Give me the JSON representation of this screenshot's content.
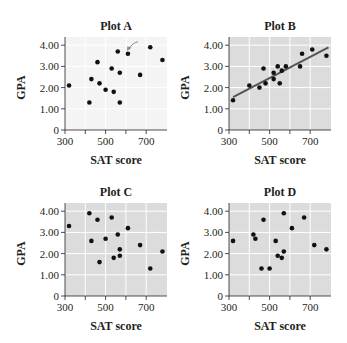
{
  "chart_data": [
    {
      "type": "scatter",
      "title": "Plot A",
      "xlabel": "SAT score",
      "ylabel": "GPA",
      "xlim": [
        300,
        800
      ],
      "ylim": [
        0,
        4.4
      ],
      "x_ticks": [
        "300",
        "500",
        "700"
      ],
      "y_ticks": [
        "0",
        "1.00",
        "2.00",
        "3.00",
        "4.00"
      ],
      "grid": true,
      "background": "#f4f4f4",
      "annotation": "arrow pointing to point near (610, 3.6)",
      "x": [
        320,
        420,
        430,
        460,
        470,
        500,
        530,
        540,
        560,
        570,
        570,
        610,
        670,
        720,
        780
      ],
      "y": [
        2.1,
        1.3,
        2.4,
        3.2,
        2.2,
        1.9,
        2.9,
        1.8,
        3.7,
        2.7,
        1.3,
        3.6,
        2.6,
        3.9,
        3.3
      ]
    },
    {
      "type": "scatter",
      "title": "Plot B",
      "xlabel": "SAT score",
      "ylabel": "GPA",
      "xlim": [
        300,
        800
      ],
      "ylim": [
        0,
        4.4
      ],
      "x_ticks": [
        "300",
        "500",
        "700"
      ],
      "y_ticks": [
        "0",
        "1.00",
        "2.00",
        "3.00",
        "4.00"
      ],
      "grid": true,
      "background": "#dcdcdc",
      "trendline": {
        "x": [
          320,
          790
        ],
        "y": [
          1.55,
          3.9
        ]
      },
      "x": [
        320,
        400,
        450,
        470,
        480,
        520,
        520,
        540,
        550,
        560,
        580,
        650,
        660,
        710,
        780
      ],
      "y": [
        1.4,
        2.1,
        2.0,
        2.9,
        2.2,
        2.7,
        2.4,
        3.0,
        2.2,
        2.8,
        3.0,
        3.0,
        3.6,
        3.8,
        3.5
      ]
    },
    {
      "type": "scatter",
      "title": "Plot C",
      "xlabel": "SAT score",
      "ylabel": "GPA",
      "xlim": [
        300,
        800
      ],
      "ylim": [
        0,
        4.4
      ],
      "x_ticks": [
        "300",
        "500",
        "700"
      ],
      "y_ticks": [
        "0",
        "1.00",
        "2.00",
        "3.00",
        "4.00"
      ],
      "grid": true,
      "background": "#dcdcdc",
      "x": [
        320,
        420,
        430,
        460,
        470,
        500,
        530,
        540,
        560,
        570,
        570,
        610,
        670,
        720,
        780
      ],
      "y": [
        3.3,
        3.9,
        2.6,
        3.6,
        1.6,
        2.7,
        3.7,
        1.8,
        2.9,
        2.2,
        1.9,
        3.2,
        2.4,
        1.3,
        2.1
      ]
    },
    {
      "type": "scatter",
      "title": "Plot D",
      "xlabel": "SAT score",
      "ylabel": "GPA",
      "xlim": [
        300,
        800
      ],
      "ylim": [
        0,
        4.4
      ],
      "x_ticks": [
        "300",
        "500",
        "700"
      ],
      "y_ticks": [
        "0",
        "1.00",
        "2.00",
        "3.00",
        "4.00"
      ],
      "grid": true,
      "background": "#dcdcdc",
      "x": [
        320,
        420,
        430,
        460,
        470,
        500,
        530,
        540,
        560,
        570,
        570,
        610,
        670,
        720,
        780
      ],
      "y": [
        2.6,
        2.9,
        2.7,
        1.3,
        3.6,
        1.3,
        2.6,
        1.9,
        1.8,
        2.1,
        3.9,
        3.2,
        3.7,
        2.4,
        2.2
      ]
    }
  ],
  "panels": [
    {
      "title": "Plot A",
      "xlabel": "SAT score",
      "ylabel": "GPA"
    },
    {
      "title": "Plot B",
      "xlabel": "SAT score",
      "ylabel": "GPA"
    },
    {
      "title": "Plot C",
      "xlabel": "SAT score",
      "ylabel": "GPA"
    },
    {
      "title": "Plot D",
      "xlabel": "SAT score",
      "ylabel": "GPA"
    }
  ],
  "colors": {
    "point": "#111111",
    "trendline": "#555555",
    "axis": "#231f20",
    "grid": "#ffffff",
    "arrow": "#888888"
  }
}
